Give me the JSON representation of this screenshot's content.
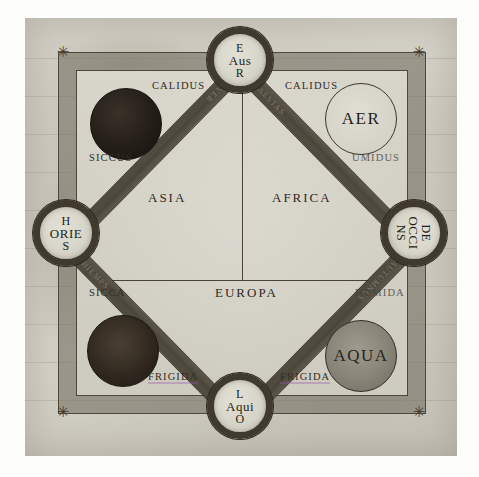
{
  "diagram": {
    "kind": "medieval-cosmological-diagram",
    "medium": "manuscript-folio",
    "title_visible": false
  },
  "cardinals": [
    {
      "id": "auster",
      "position": "top",
      "line1": "E",
      "line2": "Aus",
      "line3": "R",
      "reading": "EAUSR",
      "rotated": false
    },
    {
      "id": "oriens",
      "position": "left",
      "line1": "H",
      "line2": "ORIE",
      "line3": "S",
      "reading": "HORIES",
      "rotated": false
    },
    {
      "id": "occidens",
      "position": "right",
      "line1": "DE",
      "line2": "OCCI",
      "line3": "NS",
      "reading": "DEOCCINS",
      "rotated": true
    },
    {
      "id": "aquilo",
      "position": "bottom",
      "line1": "L",
      "line2": "Aqui",
      "line3": "O",
      "reading": "LAQUIO",
      "rotated": false
    }
  ],
  "elements": [
    {
      "id": "ignis",
      "corner": "top-left",
      "label": "",
      "style": "ignis",
      "labelled": false
    },
    {
      "id": "aer",
      "corner": "top-right",
      "label": "AER",
      "style": "aer",
      "labelled": true
    },
    {
      "id": "terra",
      "corner": "bottom-left",
      "label": "",
      "style": "terra",
      "labelled": false
    },
    {
      "id": "aqua",
      "corner": "bottom-right",
      "label": "AQUA",
      "style": "aqua",
      "labelled": true
    }
  ],
  "qualities": [
    {
      "id": "calidus-left",
      "text": "CALIDUS",
      "position": "top-left"
    },
    {
      "id": "calidus-right",
      "text": "CALIDUS",
      "position": "top-right"
    },
    {
      "id": "siccus",
      "text": "SICCUS",
      "position": "mid-left-upper"
    },
    {
      "id": "umidus",
      "text": "UMIDUS",
      "position": "mid-right-upper"
    },
    {
      "id": "sicca",
      "text": "SICCA",
      "position": "mid-left-lower"
    },
    {
      "id": "humida",
      "text": "HUMIDA",
      "position": "mid-right-lower"
    },
    {
      "id": "frigida-left",
      "text": "FRIGIDA",
      "position": "bottom-left"
    },
    {
      "id": "frigida-right",
      "text": "FRIGIDA",
      "position": "bottom-right"
    }
  ],
  "continents": [
    {
      "id": "asia",
      "text": "ASIA",
      "quadrant": "upper-left"
    },
    {
      "id": "africa",
      "text": "AFRICA",
      "quadrant": "upper-right"
    },
    {
      "id": "europa",
      "text": "EUROPA",
      "quadrant": "lower"
    }
  ],
  "bars": [
    {
      "id": "bar-top-right",
      "inscription": "AESTAS"
    },
    {
      "id": "bar-top-left",
      "inscription": "VER"
    },
    {
      "id": "bar-bottom-left",
      "inscription": "HIEMPS"
    },
    {
      "id": "bar-bottom-right",
      "inscription": "AUTUMNUS"
    }
  ],
  "corner_marks": [
    {
      "id": "corner-mark-tl",
      "glyph": "✳"
    },
    {
      "id": "corner-mark-tr",
      "glyph": "✳"
    },
    {
      "id": "corner-mark-bl",
      "glyph": "✳"
    },
    {
      "id": "corner-mark-br",
      "glyph": "✳"
    }
  ],
  "colors": {
    "parchment": "#d4d1c7",
    "ink": "#2e291f",
    "frame_band": "#777266",
    "bar_dark": "#4b463b",
    "element_dark": "#241e18",
    "element_water": "#878376"
  }
}
